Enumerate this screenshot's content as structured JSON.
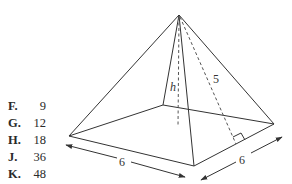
{
  "answer_choices": [
    {
      "letter": "F.",
      "value": "9"
    },
    {
      "letter": "G.",
      "value": "12"
    },
    {
      "letter": "H.",
      "value": "18"
    },
    {
      "letter": "J.",
      "value": "36"
    },
    {
      "letter": "K.",
      "value": "48"
    }
  ],
  "figure": {
    "type": "square pyramid",
    "labels": {
      "height": "h",
      "slant_height": "5",
      "base_front_edge": "6",
      "base_right_edge": "6"
    }
  }
}
